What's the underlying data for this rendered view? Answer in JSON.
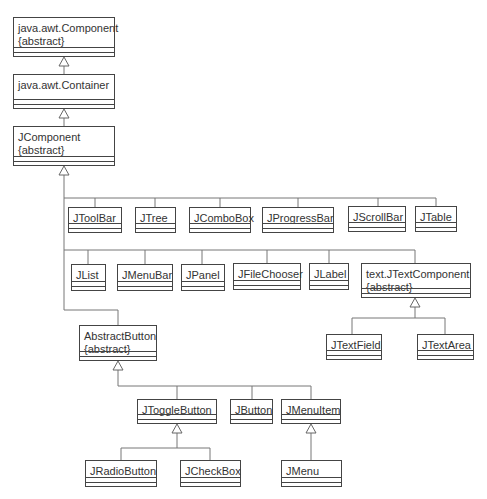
{
  "diagram": {
    "type": "uml-class-hierarchy",
    "classes": [
      {
        "id": "component",
        "name": "java.awt.Component",
        "stereotype": "{abstract}",
        "x": 13,
        "y": 17,
        "w": 102,
        "h": 40
      },
      {
        "id": "container",
        "name": "java.awt.Container",
        "x": 13,
        "y": 74,
        "w": 102,
        "h": 35
      },
      {
        "id": "jcomponent",
        "name": "JComponent",
        "stereotype": "{abstract}",
        "x": 13,
        "y": 126,
        "w": 102,
        "h": 40
      },
      {
        "id": "jtoolbar",
        "name": "JToolBar",
        "x": 68,
        "y": 207,
        "w": 54,
        "h": 26
      },
      {
        "id": "jtree",
        "name": "JTree",
        "x": 135,
        "y": 207,
        "w": 41,
        "h": 26
      },
      {
        "id": "jcombobox",
        "name": "JComboBox",
        "x": 189,
        "y": 207,
        "w": 62,
        "h": 26
      },
      {
        "id": "jprogressbar",
        "name": "JProgressBar",
        "x": 262,
        "y": 207,
        "w": 72,
        "h": 26
      },
      {
        "id": "jscrollbar",
        "name": "JScrollBar",
        "x": 348,
        "y": 206,
        "w": 58,
        "h": 26
      },
      {
        "id": "jtable",
        "name": "JTable",
        "x": 415,
        "y": 206,
        "w": 42,
        "h": 26
      },
      {
        "id": "jlist",
        "name": "JList",
        "x": 71,
        "y": 264,
        "w": 35,
        "h": 27
      },
      {
        "id": "jmenubar",
        "name": "JMenuBar",
        "x": 117,
        "y": 264,
        "w": 56,
        "h": 27
      },
      {
        "id": "jpanel",
        "name": "JPanel",
        "x": 181,
        "y": 264,
        "w": 44,
        "h": 27
      },
      {
        "id": "jfilechooser",
        "name": "JFileChooser",
        "x": 233,
        "y": 263,
        "w": 68,
        "h": 27
      },
      {
        "id": "jlabel",
        "name": "JLabel",
        "x": 309,
        "y": 263,
        "w": 40,
        "h": 27
      },
      {
        "id": "jtextcomponent",
        "name": "text.JTextComponent",
        "stereotype": "{abstract}",
        "x": 361,
        "y": 263,
        "w": 110,
        "h": 35
      },
      {
        "id": "jtextfield",
        "name": "JTextField",
        "x": 326,
        "y": 334,
        "w": 56,
        "h": 26
      },
      {
        "id": "jtextarea",
        "name": "JTextArea",
        "x": 417,
        "y": 334,
        "w": 57,
        "h": 26
      },
      {
        "id": "abstractbutton",
        "name": "AbstractButton",
        "stereotype": "{abstract}",
        "x": 79,
        "y": 325,
        "w": 78,
        "h": 36
      },
      {
        "id": "jtogglebutton",
        "name": "JToggleButton",
        "x": 137,
        "y": 399,
        "w": 80,
        "h": 25
      },
      {
        "id": "jbutton",
        "name": "JButton",
        "x": 230,
        "y": 399,
        "w": 43,
        "h": 25
      },
      {
        "id": "jmenuitem",
        "name": "JMenuItem",
        "x": 281,
        "y": 399,
        "w": 60,
        "h": 25
      },
      {
        "id": "jradiobutton",
        "name": "JRadioButton",
        "x": 85,
        "y": 460,
        "w": 72,
        "h": 27
      },
      {
        "id": "jcheckbox",
        "name": "JCheckBox",
        "x": 180,
        "y": 460,
        "w": 61,
        "h": 27
      },
      {
        "id": "jmenu",
        "name": "JMenu",
        "x": 281,
        "y": 460,
        "w": 61,
        "h": 27
      }
    ],
    "generalizations": [
      {
        "child": "container",
        "parent": "component"
      },
      {
        "child": "jcomponent",
        "parent": "container"
      },
      {
        "child": "jtoolbar",
        "parent": "jcomponent"
      },
      {
        "child": "jtree",
        "parent": "jcomponent"
      },
      {
        "child": "jcombobox",
        "parent": "jcomponent"
      },
      {
        "child": "jprogressbar",
        "parent": "jcomponent"
      },
      {
        "child": "jscrollbar",
        "parent": "jcomponent"
      },
      {
        "child": "jtable",
        "parent": "jcomponent"
      },
      {
        "child": "jlist",
        "parent": "jcomponent"
      },
      {
        "child": "jmenubar",
        "parent": "jcomponent"
      },
      {
        "child": "jpanel",
        "parent": "jcomponent"
      },
      {
        "child": "jfilechooser",
        "parent": "jcomponent"
      },
      {
        "child": "jlabel",
        "parent": "jcomponent"
      },
      {
        "child": "jtextcomponent",
        "parent": "jcomponent"
      },
      {
        "child": "abstractbutton",
        "parent": "jcomponent"
      },
      {
        "child": "jtextfield",
        "parent": "jtextcomponent"
      },
      {
        "child": "jtextarea",
        "parent": "jtextcomponent"
      },
      {
        "child": "jtogglebutton",
        "parent": "abstractbutton"
      },
      {
        "child": "jbutton",
        "parent": "abstractbutton"
      },
      {
        "child": "jmenuitem",
        "parent": "abstractbutton"
      },
      {
        "child": "jradiobutton",
        "parent": "jtogglebutton"
      },
      {
        "child": "jcheckbox",
        "parent": "jtogglebutton"
      },
      {
        "child": "jmenu",
        "parent": "jmenuitem"
      }
    ],
    "colors": {
      "line": "#444444",
      "text": "#333333",
      "wire": "#777777",
      "background": "#ffffff"
    }
  }
}
